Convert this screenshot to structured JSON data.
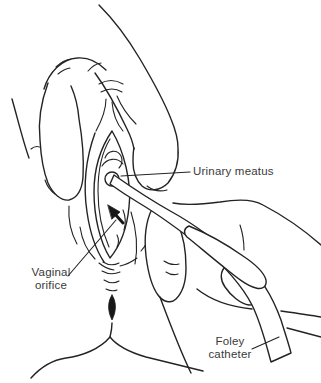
{
  "figure": {
    "background_color": "#ffffff",
    "line_color": "#232323",
    "text_color": "#3a3a3a",
    "marker_color": "#181818"
  },
  "labels": {
    "urinary_meatus": "Urinary meatus",
    "vaginal_orifice": "Vaginal\norifice",
    "foley_catheter": "Foley\ncatheter"
  }
}
